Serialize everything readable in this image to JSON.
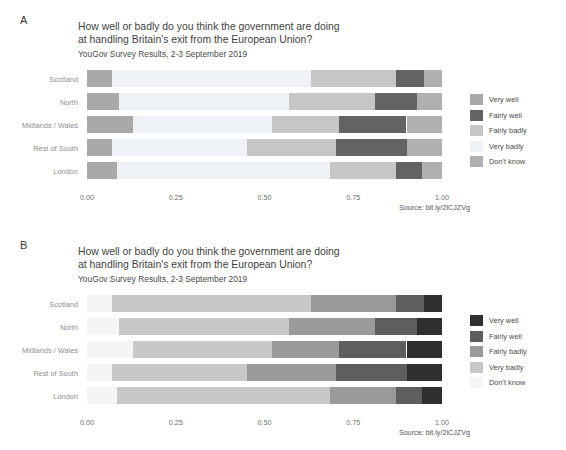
{
  "figure": {
    "background": "#ffffff",
    "panels": [
      {
        "letter": "A",
        "title_line1": "How well or badly do you think the government are doing",
        "title_line2": "at handling Britain's exit from the European Union?",
        "subtitle": "YouGov Survey Results, 2-3 September 2019",
        "source": "Source: bit.ly/2lCJZVg"
      },
      {
        "letter": "B",
        "title_line1": "How well or badly do you think the government are doing",
        "title_line2": "at handling Britain's exit from the European Union?",
        "subtitle": "YouGov Survey Results, 2-3 September 2019",
        "source": "Source: bit.ly/2lCJZVg"
      }
    ]
  },
  "chart_data": [
    {
      "type": "bar",
      "panel": "A",
      "orientation": "horizontal",
      "stacked": true,
      "normalized": true,
      "title": "How well or badly do you think the government are doing at handling Britain's exit from the European Union?",
      "subtitle": "YouGov Survey Results, 2-3 September 2019",
      "caption": "Source: bit.ly/2lCJZVg",
      "xlabel": "",
      "ylabel": "",
      "xlim": [
        0,
        1
      ],
      "xticks": [
        0,
        0.25,
        0.5,
        0.75,
        1
      ],
      "xticklabels": [
        "0.00",
        "0.25",
        "0.50",
        "0.75",
        "1.00"
      ],
      "grid": false,
      "legend_position": "right",
      "categories": [
        "Scotland",
        "North",
        "Midlands / Wales",
        "Rest of South",
        "London"
      ],
      "stack_order": [
        "Very well",
        "Very badly",
        "Fairly badly",
        "Fairly well",
        "Don't know"
      ],
      "series": [
        {
          "name": "Very well",
          "color": "#a9a9a9",
          "values": [
            0.07,
            0.09,
            0.13,
            0.07,
            0.085
          ]
        },
        {
          "name": "Fairly well",
          "color": "#636363",
          "values": [
            0.08,
            0.12,
            0.19,
            0.2,
            0.075
          ]
        },
        {
          "name": "Fairly badly",
          "color": "#c6c6c6",
          "values": [
            0.24,
            0.24,
            0.19,
            0.25,
            0.185
          ]
        },
        {
          "name": "Very badly",
          "color": "#eef1f5",
          "values": [
            0.56,
            0.48,
            0.39,
            0.38,
            0.6
          ]
        },
        {
          "name": "Don't know",
          "color": "#b0b0b0",
          "values": [
            0.05,
            0.07,
            0.1,
            0.1,
            0.055
          ]
        }
      ],
      "legend_entries": [
        {
          "label": "Very well",
          "color": "#a9a9a9"
        },
        {
          "label": "Fairly well",
          "color": "#636363"
        },
        {
          "label": "Fairly badly",
          "color": "#c6c6c6"
        },
        {
          "label": "Very badly",
          "color": "#eef1f5"
        },
        {
          "label": "Don't know",
          "color": "#b0b0b0"
        }
      ]
    },
    {
      "type": "bar",
      "panel": "B",
      "orientation": "horizontal",
      "stacked": true,
      "normalized": true,
      "title": "How well or badly do you think the government are doing at handling Britain's exit from the European Union?",
      "subtitle": "YouGov Survey Results, 2-3 September 2019",
      "caption": "Source: bit.ly/2lCJZVg",
      "xlabel": "",
      "ylabel": "",
      "xlim": [
        0,
        1
      ],
      "xticks": [
        0,
        0.25,
        0.5,
        0.75,
        1
      ],
      "xticklabels": [
        "0.00",
        "0.25",
        "0.50",
        "0.75",
        "1.00"
      ],
      "grid": false,
      "legend_position": "right",
      "categories": [
        "Scotland",
        "North",
        "Midlands / Wales",
        "Rest of South",
        "London"
      ],
      "stack_order": [
        "Don't know",
        "Very badly",
        "Fairly badly",
        "Fairly well",
        "Very well"
      ],
      "series": [
        {
          "name": "Don't know",
          "color": "#f5f5f5",
          "values": [
            0.07,
            0.09,
            0.13,
            0.07,
            0.085
          ]
        },
        {
          "name": "Very badly",
          "color": "#c8c8c8",
          "values": [
            0.56,
            0.48,
            0.39,
            0.38,
            0.6
          ]
        },
        {
          "name": "Fairly badly",
          "color": "#9a9a9a",
          "values": [
            0.24,
            0.24,
            0.19,
            0.25,
            0.185
          ]
        },
        {
          "name": "Fairly well",
          "color": "#5e5e5e",
          "values": [
            0.08,
            0.12,
            0.19,
            0.2,
            0.075
          ]
        },
        {
          "name": "Very well",
          "color": "#2f2f2f",
          "values": [
            0.05,
            0.07,
            0.1,
            0.1,
            0.055
          ]
        }
      ],
      "legend_entries": [
        {
          "label": "Very well",
          "color": "#2f2f2f"
        },
        {
          "label": "Fairly well",
          "color": "#5e5e5e"
        },
        {
          "label": "Fairly badly",
          "color": "#9a9a9a"
        },
        {
          "label": "Very badly",
          "color": "#c8c8c8"
        },
        {
          "label": "Don't know",
          "color": "#f5f5f5"
        }
      ]
    }
  ]
}
